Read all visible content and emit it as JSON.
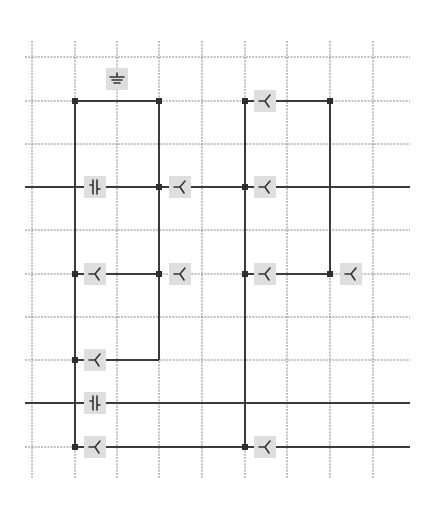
{
  "diagram": {
    "type": "grid-circuit-layout",
    "background": "#ffffff",
    "colors": {
      "grid": "#6f6f6f",
      "wire": "#3a3a3a",
      "node": "#2e2e2e",
      "symbol_box": "#dedede",
      "symbol_glyph": "#333333"
    },
    "grid": {
      "columns_x": [
        32,
        75,
        117,
        159,
        202,
        245,
        287,
        330,
        373
      ],
      "rows_y": [
        57,
        101,
        144,
        187,
        230,
        274,
        317,
        360,
        403,
        447
      ],
      "vertical_extent": [
        41,
        478
      ],
      "horizontal_extent": [
        25,
        410
      ]
    },
    "wires": [
      {
        "from": [
          75,
          101
        ],
        "to": [
          159,
          101
        ]
      },
      {
        "from": [
          245,
          101
        ],
        "to": [
          330,
          101
        ]
      },
      {
        "from": [
          75,
          101
        ],
        "to": [
          75,
          447
        ]
      },
      {
        "from": [
          159,
          101
        ],
        "to": [
          159,
          360
        ]
      },
      {
        "from": [
          245,
          101
        ],
        "to": [
          245,
          447
        ]
      },
      {
        "from": [
          330,
          101
        ],
        "to": [
          330,
          274
        ]
      },
      {
        "from": [
          25,
          187
        ],
        "to": [
          410,
          187
        ]
      },
      {
        "from": [
          75,
          274
        ],
        "to": [
          159,
          274
        ]
      },
      {
        "from": [
          245,
          274
        ],
        "to": [
          330,
          274
        ]
      },
      {
        "from": [
          75,
          360
        ],
        "to": [
          159,
          360
        ]
      },
      {
        "from": [
          25,
          403
        ],
        "to": [
          410,
          403
        ]
      },
      {
        "from": [
          75,
          447
        ],
        "to": [
          410,
          447
        ]
      }
    ],
    "nodes": [
      [
        75,
        101
      ],
      [
        159,
        101
      ],
      [
        245,
        101
      ],
      [
        330,
        101
      ],
      [
        159,
        187
      ],
      [
        245,
        187
      ],
      [
        75,
        274
      ],
      [
        159,
        274
      ],
      [
        245,
        274
      ],
      [
        330,
        274
      ],
      [
        75,
        360
      ],
      [
        75,
        447
      ],
      [
        245,
        447
      ]
    ],
    "symbols": [
      {
        "kind": "ground",
        "x": 117,
        "y": 79
      },
      {
        "kind": "switch",
        "x": 265,
        "y": 101
      },
      {
        "kind": "capacitor",
        "x": 95,
        "y": 187
      },
      {
        "kind": "switch",
        "x": 180,
        "y": 187
      },
      {
        "kind": "switch",
        "x": 265,
        "y": 187
      },
      {
        "kind": "switch",
        "x": 95,
        "y": 274
      },
      {
        "kind": "switch",
        "x": 180,
        "y": 274
      },
      {
        "kind": "switch",
        "x": 265,
        "y": 274
      },
      {
        "kind": "switch",
        "x": 351,
        "y": 274
      },
      {
        "kind": "switch",
        "x": 95,
        "y": 360
      },
      {
        "kind": "capacitor",
        "x": 95,
        "y": 403
      },
      {
        "kind": "switch",
        "x": 95,
        "y": 447
      },
      {
        "kind": "switch",
        "x": 265,
        "y": 447
      }
    ]
  }
}
